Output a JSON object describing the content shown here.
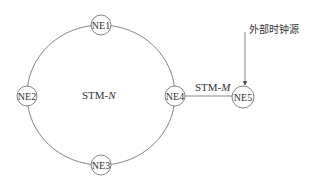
{
  "diagram": {
    "type": "network-topology",
    "ring": {
      "label_prefix": "STM-",
      "label_var": "N",
      "center": [
        101,
        95
      ],
      "rx": 74,
      "ry": 70
    },
    "nodes": [
      {
        "id": "NE1",
        "label": "NE1",
        "x": 101,
        "y": 25
      },
      {
        "id": "NE2",
        "label": "NE2",
        "x": 27,
        "y": 96
      },
      {
        "id": "NE3",
        "label": "NE3",
        "x": 101,
        "y": 165
      },
      {
        "id": "NE4",
        "label": "NE4",
        "x": 175,
        "y": 96
      },
      {
        "id": "NE5",
        "label": "NE5",
        "x": 243,
        "y": 97
      }
    ],
    "link": {
      "from": "NE4",
      "to": "NE5",
      "label_prefix": "STM-",
      "label_var": "M"
    },
    "clock_source": {
      "label": "外部时钟源",
      "target": "NE5"
    },
    "colors": {
      "stroke": "#555555",
      "text": "#333333",
      "background": "#ffffff"
    }
  }
}
